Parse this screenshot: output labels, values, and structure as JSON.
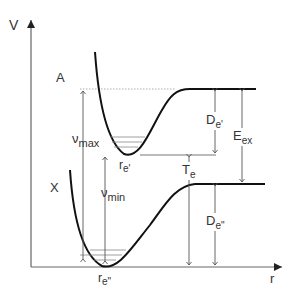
{
  "diagram": {
    "type": "potential-energy-curves",
    "axes": {
      "y_label": "V",
      "x_label": "r"
    },
    "states": [
      {
        "name": "A",
        "label": "A",
        "equilibrium_label": "r",
        "equilibrium_sub": "e'"
      },
      {
        "name": "X",
        "label": "X",
        "equilibrium_label": "r",
        "equilibrium_sub": "e\""
      }
    ],
    "annotations": {
      "nu_max": {
        "main": "ν",
        "sub": "max"
      },
      "nu_min": {
        "main": "ν",
        "sub": "min"
      },
      "De_upper": {
        "main": "D",
        "sub": "e'"
      },
      "De_lower": {
        "main": "D",
        "sub": "e\""
      },
      "E_ex": {
        "main": "E",
        "sub": "ex"
      },
      "T_e": {
        "main": "T",
        "sub": "e"
      }
    },
    "colors": {
      "curve": "#111111",
      "axis": "#555555",
      "arrow": "#555555",
      "dashed": "#999999",
      "levels": "#888888"
    }
  }
}
